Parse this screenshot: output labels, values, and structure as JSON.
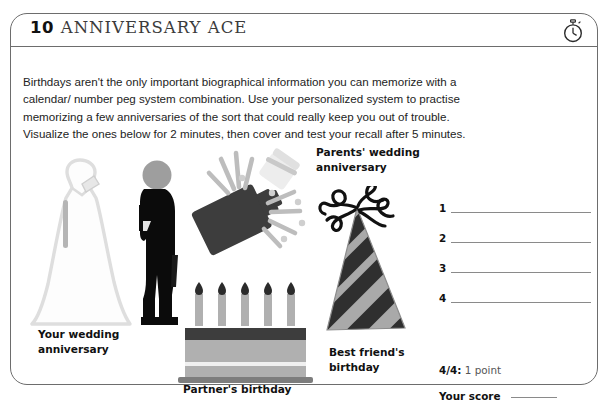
{
  "header": {
    "number": "10",
    "title": "ANNIVERSARY ACE",
    "timer_icon": "stopwatch-icon"
  },
  "intro": {
    "text": "Birthdays aren't the only important biographical information you can memorize with a calendar/ number peg system combination. Use your personalized system to practise memorizing a few anniversaries of the sort that could really keep you out of trouble. Visualize the ones below for 2 minutes, then cover and test your recall after 5 minutes."
  },
  "illustrations": [
    {
      "id": "wedding-dress",
      "icon": "wedding-dress-icon",
      "caption": "Your wedding\nanniversary"
    },
    {
      "id": "groom",
      "icon": "groom-silhouette-icon",
      "caption": ""
    },
    {
      "id": "champagne",
      "icon": "champagne-bottle-popping-icon",
      "caption": "Parents' wedding\nanniversary"
    },
    {
      "id": "party-hat",
      "icon": "party-hat-icon",
      "caption": "Best friend's\nbirthday"
    },
    {
      "id": "birthday-cake",
      "icon": "birthday-cake-icon",
      "caption": "Partner's birthday"
    }
  ],
  "captions": {
    "your_wedding_line1": "Your wedding",
    "your_wedding_line2": "anniversary",
    "parents_line1": "Parents' wedding",
    "parents_line2": "anniversary",
    "best_friend_line1": "Best friend's",
    "best_friend_line2": "birthday",
    "partner": "Partner's birthday"
  },
  "answers": {
    "items": [
      {
        "number": "1",
        "value": ""
      },
      {
        "number": "2",
        "value": ""
      },
      {
        "number": "3",
        "value": ""
      },
      {
        "number": "4",
        "value": ""
      }
    ]
  },
  "scoring": {
    "points_score": "4/4:",
    "points_label": " 1 point",
    "your_score_label": "Your score",
    "your_score_value": ""
  },
  "colors": {
    "border": "#6d6d6d",
    "text": "#232323",
    "line": "#8a8a8a",
    "dark_fill": "#3d3d3d",
    "mid_gray": "#a8a8a8",
    "light_gray": "#d9d9d9"
  }
}
